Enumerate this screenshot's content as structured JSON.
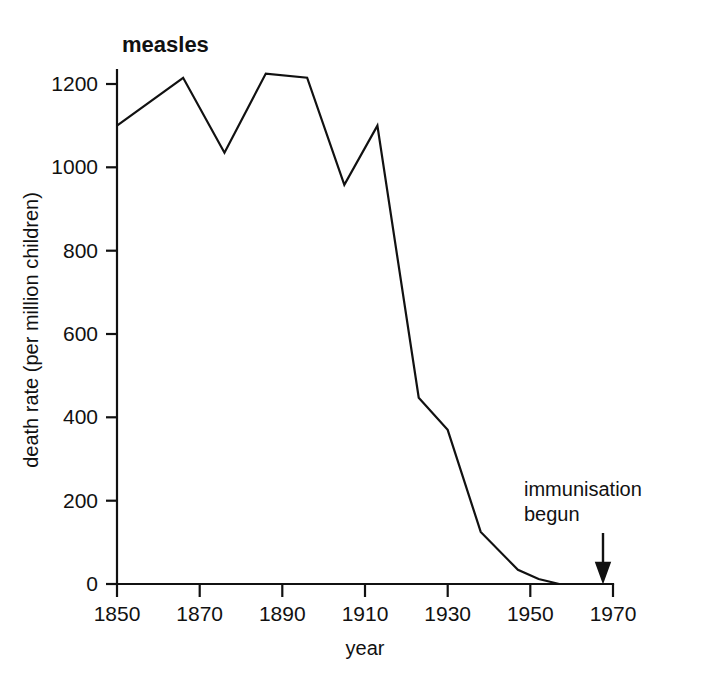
{
  "chart_data": {
    "type": "line",
    "title": "measles",
    "xlabel": "year",
    "ylabel": "death rate (per million children)",
    "xlim": [
      1850,
      1970
    ],
    "ylim": [
      0,
      1260
    ],
    "grid": false,
    "legend": "none",
    "x_ticks": [
      "1850",
      "1870",
      "1890",
      "1910",
      "1930",
      "1950",
      "1970"
    ],
    "x_tick_values": [
      1850,
      1870,
      1890,
      1910,
      1930,
      1950,
      1970
    ],
    "y_ticks": [
      "0",
      "200",
      "400",
      "600",
      "800",
      "1000",
      "1200"
    ],
    "y_tick_values": [
      0,
      200,
      400,
      600,
      800,
      1000,
      1200
    ],
    "series": [
      {
        "name": "measles death rate",
        "color": "#111111",
        "x": [
          1850,
          1866,
          1876,
          1886,
          1896,
          1905,
          1913,
          1923,
          1930,
          1938,
          1947,
          1952,
          1957,
          1970
        ],
        "values": [
          1100,
          1215,
          1035,
          1225,
          1215,
          958,
          1100,
          447,
          370,
          125,
          34,
          12,
          0,
          0
        ]
      }
    ],
    "annotations": [
      {
        "name": "immunisation-begun",
        "line1": "immunisation",
        "line2": "begun",
        "arrow": "down-arrow",
        "x": 1967,
        "y": 0
      }
    ]
  }
}
